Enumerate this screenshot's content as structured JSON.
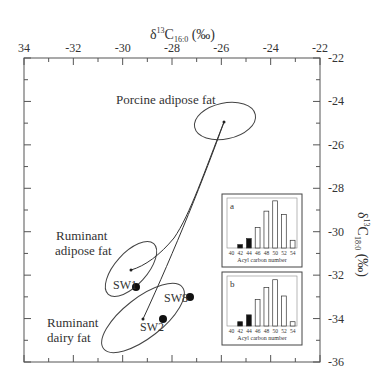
{
  "chart_data": {
    "type": "scatter",
    "title": "",
    "xlabel": "δ13C16:0 (‰)",
    "xlabel_main": "δ",
    "xlabel_sup": "13",
    "xlabel_c": "C",
    "xlabel_sub": "16:0",
    "xlabel_unit": " (‰)",
    "ylabel": "δ13C18:0 (‰)",
    "ylabel_main": "δ",
    "ylabel_sup": "13",
    "ylabel_c": "C",
    "ylabel_sub": "18:0",
    "ylabel_unit": " (‰)",
    "xlim": [
      -34,
      -22
    ],
    "ylim": [
      -36,
      -22
    ],
    "x_ticks": [
      "34",
      "-32",
      "-30",
      "-28",
      "-26",
      "-24",
      "-22"
    ],
    "y_ticks": [
      "-22",
      "-24",
      "-26",
      "-28",
      "-30",
      "-32",
      "-34",
      "-36"
    ],
    "reference_ellipses": [
      {
        "name": "Porcine adipose fat",
        "center": [
          -25.9,
          -24.95
        ],
        "label": "Porcine adipose fat"
      },
      {
        "name": "Ruminant adipose fat",
        "center": [
          -29.7,
          -31.8
        ],
        "label_lines": [
          "Ruminant",
          "adipose fat"
        ]
      },
      {
        "name": "Ruminant dairy fat",
        "center": [
          -29.2,
          -34.0
        ],
        "label_lines": [
          "Ruminant",
          "dairy fat"
        ]
      }
    ],
    "samples": [
      {
        "label": "SW1",
        "x": -29.5,
        "y": -32.5
      },
      {
        "label": "SW2",
        "x": -28.4,
        "y": -34.0
      },
      {
        "label": "SW8",
        "x": -27.3,
        "y": -33.0
      }
    ],
    "mixing_lines": [
      {
        "from": "Porcine adipose fat",
        "to": "Ruminant adipose fat"
      },
      {
        "from": "Porcine adipose fat",
        "to": "Ruminant dairy fat"
      }
    ],
    "insets": [
      {
        "label": "a",
        "type": "bar",
        "xlabel": "Acyl carbon number",
        "categories": [
          "40",
          "42",
          "44",
          "46",
          "48",
          "50",
          "52",
          "54"
        ],
        "values": [
          0,
          4,
          11,
          24,
          43,
          55,
          39,
          9
        ],
        "filled": [
          false,
          true,
          true,
          false,
          false,
          false,
          false,
          false
        ]
      },
      {
        "label": "b",
        "type": "bar",
        "xlabel": "Acyl carbon number",
        "categories": [
          "40",
          "42",
          "44",
          "46",
          "48",
          "50",
          "52",
          "54"
        ],
        "values": [
          0,
          5,
          13,
          31,
          45,
          54,
          35,
          5
        ],
        "filled": [
          false,
          true,
          true,
          false,
          false,
          false,
          false,
          false
        ]
      }
    ]
  }
}
